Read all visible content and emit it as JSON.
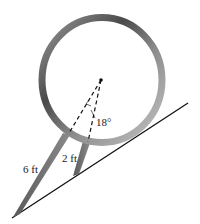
{
  "diagram": {
    "type": "geometry-figure",
    "ring": {
      "cx": 102,
      "cy": 80,
      "rx": 60,
      "ry": 62.5,
      "thickness": 7
    },
    "labels": {
      "angle": "18°",
      "long_leg": "6 ft",
      "short_leg": "2 ft"
    },
    "colors": {
      "ring_dark": "#4a4a4a",
      "ring_light": "#b8b8b8",
      "leg": "#6e6e6e",
      "line": "#111111",
      "background": "#ffffff"
    }
  }
}
